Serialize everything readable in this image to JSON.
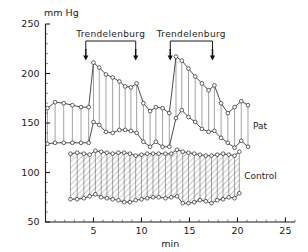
{
  "figure": {
    "unit_label": "mm Hg",
    "xlabel": "min",
    "ylabel": ""
  },
  "annotations": {
    "first": {
      "label": "Trendelenburg",
      "start_min": 4.2,
      "end_min": 9.4
    },
    "second": {
      "label": "Trendelenburg",
      "start_min": 13.0,
      "end_min": 17.4
    }
  },
  "series_labels": {
    "pat": "Pat",
    "control": "Control"
  },
  "chart_data": {
    "type": "line",
    "title": "",
    "subtitle": "",
    "xlabel": "min",
    "ylabel": "mm Hg",
    "xlim": [
      0,
      26
    ],
    "ylim": [
      50,
      250
    ],
    "xticks": [
      5,
      10,
      15,
      20,
      25
    ],
    "xtick_labels": [
      "5",
      "10",
      "15",
      "20",
      "25"
    ],
    "xtick_minor_step": 1,
    "yticks": [
      50,
      100,
      150,
      200,
      250
    ],
    "ytick_labels": [
      "50",
      "100",
      "150",
      "200",
      "250"
    ],
    "ytick_minor_step": 10,
    "grid": false,
    "legend_position": "right-inline",
    "annotations": [
      {
        "text": "Trendelenburg",
        "x_start": 4.2,
        "x_end": 9.4,
        "type": "bracket-with-arrows"
      },
      {
        "text": "Trendelenburg",
        "x_start": 13.0,
        "x_end": 17.4,
        "type": "bracket-with-arrows"
      }
    ],
    "series": [
      {
        "name": "Pat systolic",
        "group": "Pat",
        "marker": "open-circle",
        "x": [
          0.2,
          1.0,
          1.9,
          2.8,
          3.7,
          4.5,
          5.0,
          5.6,
          6.3,
          7.0,
          7.7,
          8.3,
          8.9,
          9.5,
          10.2,
          10.9,
          11.5,
          12.2,
          12.9,
          13.6,
          14.2,
          14.9,
          15.6,
          16.3,
          17.0,
          17.6,
          18.3,
          19.0,
          19.7,
          20.4,
          21.1
        ],
        "values": [
          165,
          171,
          170,
          168,
          166,
          166,
          211,
          206,
          199,
          196,
          192,
          187,
          186,
          190,
          170,
          162,
          166,
          165,
          160,
          217,
          213,
          205,
          197,
          190,
          183,
          188,
          170,
          160,
          166,
          172,
          168
        ]
      },
      {
        "name": "Pat diastolic",
        "group": "Pat",
        "marker": "open-circle",
        "x": [
          0.2,
          1.0,
          1.9,
          2.8,
          3.7,
          4.5,
          5.0,
          5.6,
          6.3,
          7.0,
          7.7,
          8.3,
          8.9,
          9.5,
          10.2,
          10.9,
          11.5,
          12.2,
          12.9,
          13.6,
          14.2,
          14.9,
          15.6,
          16.3,
          17.0,
          17.6,
          18.3,
          19.0,
          19.7,
          20.4,
          21.1
        ],
        "values": [
          129,
          130,
          130,
          130,
          130,
          130,
          151,
          148,
          141,
          140,
          143,
          143,
          142,
          140,
          131,
          126,
          131,
          126,
          126,
          155,
          163,
          156,
          151,
          144,
          141,
          142,
          135,
          130,
          125,
          132,
          126
        ]
      },
      {
        "name": "Control systolic",
        "group": "Control",
        "marker": "open-circle",
        "x": [
          2.6,
          3.3,
          4.0,
          4.6,
          5.2,
          5.8,
          6.4,
          7.0,
          7.6,
          8.2,
          8.8,
          9.4,
          10.0,
          10.6,
          11.2,
          11.8,
          12.5,
          13.1,
          13.7,
          14.3,
          14.9,
          15.5,
          16.1,
          16.7,
          17.3,
          17.9,
          18.5,
          19.1,
          19.7,
          20.2
        ],
        "values": [
          119,
          120,
          119,
          118,
          122,
          121,
          120,
          119,
          120,
          120,
          119,
          117,
          118,
          119,
          119,
          119,
          119,
          119,
          123,
          121,
          120,
          119,
          118,
          117,
          117,
          118,
          119,
          118,
          117,
          121
        ]
      },
      {
        "name": "Control diastolic",
        "group": "Control",
        "marker": "open-circle",
        "x": [
          2.6,
          3.3,
          4.0,
          4.6,
          5.2,
          5.8,
          6.4,
          7.0,
          7.6,
          8.2,
          8.8,
          9.4,
          10.0,
          10.6,
          11.2,
          11.8,
          12.5,
          13.1,
          13.7,
          14.3,
          14.9,
          15.5,
          16.1,
          16.7,
          17.3,
          17.9,
          18.5,
          19.1,
          19.7,
          20.2
        ],
        "values": [
          73,
          73,
          74,
          76,
          78,
          75,
          74,
          73,
          72,
          70,
          70,
          72,
          73,
          74,
          75,
          75,
          74,
          75,
          76,
          69,
          69,
          70,
          72,
          71,
          69,
          72,
          73,
          75,
          74,
          79
        ]
      }
    ]
  }
}
